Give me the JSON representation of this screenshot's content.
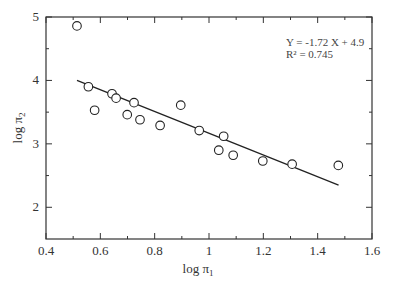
{
  "chart_data": {
    "type": "scatter",
    "title": "",
    "xlabel": "log π",
    "xlabel_sub": "1",
    "ylabel": "log π",
    "ylabel_sub": "2",
    "xlim": [
      0.4,
      1.6
    ],
    "ylim": [
      1.5,
      5
    ],
    "x_ticks": [
      0.4,
      0.6,
      0.8,
      1.0,
      1.2,
      1.4,
      1.6
    ],
    "x_tick_labels": [
      "0.4",
      "0.6",
      "0.8",
      "1",
      "1.2",
      "1.4",
      "1.6"
    ],
    "x_minor_ticks": [
      0.5,
      0.7,
      0.9,
      1.1,
      1.3,
      1.5
    ],
    "y_ticks": [
      2,
      3,
      4,
      5
    ],
    "y_tick_labels": [
      "2",
      "3",
      "4",
      "5"
    ],
    "y_minor_ticks": [
      2.5,
      3.5,
      4.5
    ],
    "grid": false,
    "legend": null,
    "series": [
      {
        "name": "observations",
        "marker": "open-circle",
        "points": [
          {
            "x": 0.514,
            "y": 4.86
          },
          {
            "x": 0.556,
            "y": 3.9
          },
          {
            "x": 0.579,
            "y": 3.53
          },
          {
            "x": 0.643,
            "y": 3.79
          },
          {
            "x": 0.658,
            "y": 3.72
          },
          {
            "x": 0.699,
            "y": 3.46
          },
          {
            "x": 0.724,
            "y": 3.65
          },
          {
            "x": 0.746,
            "y": 3.38
          },
          {
            "x": 0.82,
            "y": 3.29
          },
          {
            "x": 0.896,
            "y": 3.61
          },
          {
            "x": 0.964,
            "y": 3.21
          },
          {
            "x": 1.036,
            "y": 2.9
          },
          {
            "x": 1.054,
            "y": 3.12
          },
          {
            "x": 1.089,
            "y": 2.82
          },
          {
            "x": 1.198,
            "y": 2.73
          },
          {
            "x": 1.306,
            "y": 2.68
          },
          {
            "x": 1.476,
            "y": 2.66
          }
        ]
      },
      {
        "name": "linear fit",
        "type": "line",
        "slope": -1.72,
        "intercept": 4.9,
        "x_range": [
          0.514,
          1.477
        ],
        "points": [
          {
            "x": 0.514,
            "y": 4.0
          },
          {
            "x": 1.477,
            "y": 2.35
          }
        ]
      }
    ],
    "annotations": [
      {
        "text": "Y = -1.72 X + 4.9",
        "x": 1.26,
        "y": 4.68
      },
      {
        "text": "R² = 0.745",
        "x": 1.26,
        "y": 4.5
      }
    ]
  },
  "annotation": {
    "equation": "Y = -1.72 X + 4.9",
    "r_squared": "R² = 0.745"
  },
  "axes": {
    "x_title": "log π",
    "x_title_sub": "1",
    "y_title": "log π",
    "y_title_sub": "2"
  },
  "style": {
    "frame_color": "#333333",
    "marker_stroke": "#222222",
    "line_color": "#222222",
    "background": "#ffffff"
  }
}
